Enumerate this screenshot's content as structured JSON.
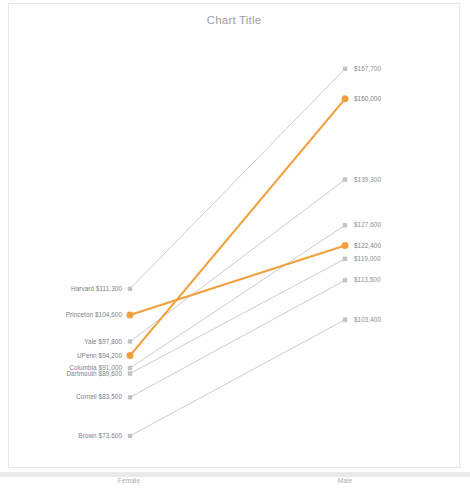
{
  "chart": {
    "title": "Chart Title"
  },
  "axis": {
    "left_category": "Female",
    "right_category": "Male"
  },
  "colors": {
    "highlight": "#F2A03D",
    "muted": "#BFC3C6",
    "title_text": "#9AA0A6",
    "label_text": "#7D8184",
    "frame_border": "#E6E6E6"
  },
  "chart_data": {
    "type": "line",
    "title": "Chart Title",
    "xlabel": "",
    "ylabel": "",
    "categories": [
      "Female",
      "Male"
    ],
    "grid": false,
    "legend": "none",
    "ylim": [
      70000,
      172000
    ],
    "value_prefix": "$",
    "series": [
      {
        "name": "Harvard",
        "highlight": false,
        "left_label": "Harvard  $111,300",
        "right_label": "$167,700",
        "values": [
          111300,
          167700
        ]
      },
      {
        "name": "Princeton",
        "highlight": true,
        "left_label": "Princeton  $104,600",
        "right_label": "$122,400",
        "values": [
          104600,
          122400
        ]
      },
      {
        "name": "Yale",
        "highlight": false,
        "left_label": "Yale  $97,800",
        "right_label": "$139,300",
        "values": [
          97800,
          139300
        ]
      },
      {
        "name": "UPenn",
        "highlight": true,
        "left_label": "UPenn  $94,200",
        "right_label": "$160,000",
        "values": [
          94200,
          160000
        ]
      },
      {
        "name": "Columbia",
        "highlight": false,
        "left_label": "Columbia  $91,000",
        "right_label": "$127,600",
        "values": [
          91000,
          127600
        ]
      },
      {
        "name": "Dartmouth",
        "highlight": false,
        "left_label": "Dartmouth  $89,600",
        "right_label": "$119,000",
        "values": [
          89600,
          119000
        ]
      },
      {
        "name": "Cornell",
        "highlight": false,
        "left_label": "Cornell  $83,500",
        "right_label": "$113,500",
        "values": [
          83500,
          113500
        ]
      },
      {
        "name": "Brown",
        "highlight": false,
        "left_label": "Brown  $73,600",
        "right_label": "$103,400",
        "values": [
          73600,
          103400
        ]
      }
    ]
  }
}
